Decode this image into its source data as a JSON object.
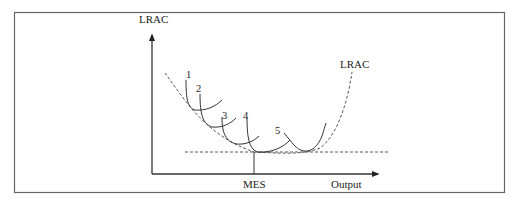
{
  "diagram": {
    "y_axis_label": "LRAC",
    "x_axis_label": "Output",
    "curve_label": "LRAC",
    "mes_label": "MES",
    "srac_labels": [
      "1",
      "2",
      "3",
      "4",
      "5"
    ]
  },
  "colors": {
    "line": "#333333",
    "frame": "#666666",
    "background": "#ffffff"
  }
}
